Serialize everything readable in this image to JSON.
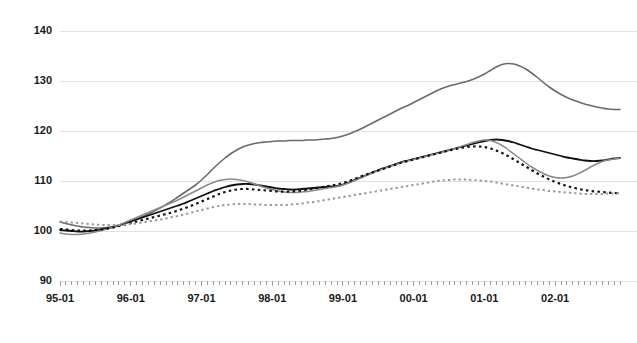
{
  "chart_data": {
    "type": "line",
    "title": "",
    "xlabel": "",
    "ylabel": "",
    "ylim": [
      90,
      140
    ],
    "yticks": [
      90,
      100,
      110,
      120,
      130,
      140
    ],
    "grid": true,
    "legend": "none",
    "x_tick_labels": [
      "95-01",
      "96-01",
      "97-01",
      "98-01",
      "99-01",
      "00-01",
      "01-01",
      "02-01"
    ],
    "x_minor_ticks": "monthly",
    "x_range": [
      "95-01",
      "02-12"
    ],
    "series": [
      {
        "name": "series-1",
        "style": "solid",
        "color": "#6b6b6b",
        "width": 1.6,
        "values": [
          101.8,
          101.5,
          101.2,
          101.0,
          100.8,
          100.7,
          100.6,
          100.6,
          100.7,
          100.9,
          101.2,
          101.6,
          102.0,
          102.4,
          102.9,
          103.4,
          104.0,
          104.6,
          105.3,
          106.0,
          106.8,
          107.6,
          108.4,
          109.2,
          110.2,
          111.3,
          112.5,
          113.6,
          114.6,
          115.5,
          116.2,
          116.8,
          117.2,
          117.5,
          117.7,
          117.8,
          117.9,
          118.0,
          118.0,
          118.1,
          118.1,
          118.1,
          118.2,
          118.2,
          118.3,
          118.4,
          118.5,
          118.7,
          119.0,
          119.4,
          119.9,
          120.4,
          121.0,
          121.6,
          122.2,
          122.8,
          123.4,
          124.0,
          124.6,
          125.1,
          125.7,
          126.3,
          126.9,
          127.5,
          128.1,
          128.6,
          129.0,
          129.3,
          129.6,
          129.9,
          130.3,
          130.8,
          131.4,
          132.1,
          132.8,
          133.3,
          133.5,
          133.4,
          133.0,
          132.4,
          131.6,
          130.7,
          129.7,
          128.8,
          128.0,
          127.3,
          126.7,
          126.2,
          125.8,
          125.4,
          125.1,
          124.8,
          124.6,
          124.4,
          124.3,
          124.3
        ]
      },
      {
        "name": "series-2",
        "style": "solid",
        "color": "#111111",
        "width": 1.8,
        "values": [
          100.2,
          100.1,
          100.0,
          99.9,
          99.9,
          100.0,
          100.1,
          100.3,
          100.5,
          100.8,
          101.1,
          101.5,
          101.9,
          102.3,
          102.7,
          103.1,
          103.5,
          103.9,
          104.3,
          104.7,
          105.1,
          105.5,
          106.0,
          106.5,
          107.0,
          107.5,
          108.0,
          108.4,
          108.8,
          109.1,
          109.3,
          109.4,
          109.4,
          109.3,
          109.1,
          108.9,
          108.7,
          108.5,
          108.4,
          108.3,
          108.3,
          108.4,
          108.5,
          108.6,
          108.7,
          108.8,
          108.9,
          109.0,
          109.3,
          109.7,
          110.2,
          110.7,
          111.2,
          111.7,
          112.2,
          112.6,
          113.0,
          113.4,
          113.8,
          114.1,
          114.4,
          114.7,
          115.0,
          115.3,
          115.6,
          115.9,
          116.2,
          116.5,
          116.8,
          117.1,
          117.4,
          117.7,
          118.0,
          118.2,
          118.3,
          118.2,
          118.0,
          117.7,
          117.3,
          116.9,
          116.5,
          116.2,
          115.9,
          115.6,
          115.3,
          115.0,
          114.7,
          114.5,
          114.3,
          114.1,
          114.0,
          114.0,
          114.1,
          114.3,
          114.5,
          114.6
        ]
      },
      {
        "name": "series-3",
        "style": "solid",
        "color": "#8a8a8a",
        "width": 1.5,
        "values": [
          99.6,
          99.4,
          99.3,
          99.3,
          99.4,
          99.6,
          99.8,
          100.1,
          100.4,
          100.8,
          101.2,
          101.7,
          102.2,
          102.7,
          103.2,
          103.7,
          104.2,
          104.7,
          105.2,
          105.7,
          106.2,
          106.8,
          107.4,
          108.0,
          108.6,
          109.2,
          109.7,
          110.1,
          110.3,
          110.4,
          110.3,
          110.1,
          109.8,
          109.4,
          109.0,
          108.6,
          108.3,
          108.0,
          107.8,
          107.7,
          107.7,
          107.8,
          107.9,
          108.1,
          108.3,
          108.5,
          108.7,
          108.9,
          109.2,
          109.6,
          110.1,
          110.6,
          111.1,
          111.6,
          112.1,
          112.5,
          112.9,
          113.3,
          113.7,
          114.0,
          114.3,
          114.6,
          114.9,
          115.2,
          115.5,
          115.8,
          116.1,
          116.5,
          116.9,
          117.3,
          117.7,
          118.0,
          118.2,
          118.1,
          117.7,
          117.1,
          116.3,
          115.4,
          114.5,
          113.6,
          112.8,
          112.1,
          111.5,
          111.0,
          110.7,
          110.6,
          110.7,
          111.0,
          111.5,
          112.1,
          112.8,
          113.4,
          113.9,
          114.2,
          114.4,
          114.5
        ]
      },
      {
        "name": "series-4",
        "style": "dotted",
        "color": "#111111",
        "width": 2.2,
        "values": [
          100.4,
          100.3,
          100.2,
          100.1,
          100.1,
          100.1,
          100.2,
          100.3,
          100.5,
          100.7,
          101.0,
          101.3,
          101.6,
          101.9,
          102.2,
          102.5,
          102.8,
          103.1,
          103.4,
          103.7,
          104.1,
          104.5,
          104.9,
          105.4,
          105.9,
          106.4,
          106.9,
          107.4,
          107.8,
          108.1,
          108.3,
          108.4,
          108.4,
          108.3,
          108.2,
          108.1,
          108.0,
          107.9,
          107.9,
          107.9,
          108.0,
          108.1,
          108.3,
          108.5,
          108.7,
          108.9,
          109.1,
          109.3,
          109.6,
          110.0,
          110.4,
          110.9,
          111.3,
          111.7,
          112.1,
          112.5,
          112.9,
          113.3,
          113.7,
          114.0,
          114.3,
          114.6,
          114.9,
          115.2,
          115.5,
          115.8,
          116.1,
          116.4,
          116.6,
          116.8,
          116.9,
          116.9,
          116.8,
          116.5,
          116.1,
          115.6,
          115.0,
          114.3,
          113.6,
          112.9,
          112.2,
          111.5,
          110.9,
          110.3,
          109.8,
          109.4,
          109.0,
          108.7,
          108.4,
          108.2,
          108.0,
          107.9,
          107.8,
          107.7,
          107.6,
          107.6
        ]
      },
      {
        "name": "series-5",
        "style": "dotted",
        "color": "#9a9a9a",
        "width": 2.0,
        "values": [
          101.9,
          101.8,
          101.7,
          101.6,
          101.5,
          101.4,
          101.3,
          101.2,
          101.2,
          101.2,
          101.2,
          101.3,
          101.4,
          101.5,
          101.7,
          101.9,
          102.1,
          102.3,
          102.5,
          102.8,
          103.0,
          103.3,
          103.6,
          103.9,
          104.2,
          104.5,
          104.8,
          105.0,
          105.2,
          105.3,
          105.4,
          105.4,
          105.4,
          105.3,
          105.3,
          105.2,
          105.2,
          105.2,
          105.2,
          105.3,
          105.4,
          105.5,
          105.7,
          105.8,
          106.0,
          106.2,
          106.4,
          106.6,
          106.8,
          107.0,
          107.2,
          107.4,
          107.6,
          107.8,
          108.0,
          108.2,
          108.4,
          108.6,
          108.8,
          109.0,
          109.2,
          109.4,
          109.6,
          109.8,
          110.0,
          110.1,
          110.2,
          110.3,
          110.3,
          110.3,
          110.2,
          110.1,
          110.0,
          109.9,
          109.7,
          109.5,
          109.3,
          109.1,
          108.9,
          108.7,
          108.5,
          108.3,
          108.2,
          108.0,
          107.9,
          107.8,
          107.7,
          107.6,
          107.5,
          107.4,
          107.4,
          107.4,
          107.4,
          107.5,
          107.5,
          107.6
        ]
      }
    ]
  }
}
